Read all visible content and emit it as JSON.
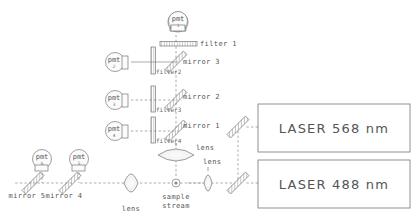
{
  "diagram": {
    "background_color": "#ffffff",
    "line_color": "#777777",
    "text_color": "#555555"
  },
  "detectors": [
    {
      "id": "pmt-1",
      "label": "pmt",
      "number": "1",
      "x": 178,
      "y": 21
    },
    {
      "id": "pmt-2",
      "label": "pmt",
      "number": "2",
      "x": 115,
      "y": 62
    },
    {
      "id": "pmt-3",
      "label": "pmt",
      "number": "3",
      "x": 115,
      "y": 100
    },
    {
      "id": "pmt-4",
      "label": "pmt",
      "number": "4",
      "x": 115,
      "y": 131
    },
    {
      "id": "pmt-5",
      "label": "pmt",
      "number": "5",
      "x": 79,
      "y": 160
    },
    {
      "id": "pmt-6",
      "label": "pmt",
      "number": "6",
      "x": 42,
      "y": 160
    }
  ],
  "filters": [
    {
      "id": "filter-1",
      "label": "filter 1",
      "orientation": "horizontal",
      "x": 180,
      "y": 44
    },
    {
      "id": "filter-2",
      "label": "filter2",
      "orientation": "vertical",
      "x": 153,
      "y": 62
    },
    {
      "id": "filter-3",
      "label": "filter3",
      "orientation": "vertical",
      "x": 153,
      "y": 100
    },
    {
      "id": "filter-4",
      "label": "filter4",
      "orientation": "vertical",
      "x": 153,
      "y": 131
    }
  ],
  "mirrors": [
    {
      "id": "mirror-1",
      "label": "mirror 1",
      "x": 185,
      "y": 125
    },
    {
      "id": "mirror-2",
      "label": "mirror 2",
      "x": 185,
      "y": 95
    },
    {
      "id": "mirror-3",
      "label": "mirror 3",
      "x": 185,
      "y": 60
    },
    {
      "id": "mirror-4",
      "label": "mirror 4",
      "x": 70,
      "y": 182
    },
    {
      "id": "mirror-5",
      "label": "mirror 5",
      "x": 32,
      "y": 182
    },
    {
      "id": "mirror-laser-568",
      "label": "",
      "x": 238,
      "y": 127
    },
    {
      "id": "mirror-laser-488",
      "label": "",
      "x": 238,
      "y": 183
    }
  ],
  "lenses": [
    {
      "id": "lens-collection",
      "label": "lens",
      "orientation": "horizontal",
      "x": 178,
      "y": 155
    },
    {
      "id": "lens-forward",
      "label": "lens",
      "orientation": "vertical",
      "x": 208,
      "y": 180
    },
    {
      "id": "lens-scatter",
      "label": "lens",
      "orientation": "vertical",
      "x": 131,
      "y": 180
    }
  ],
  "sample": {
    "id": "sample-stream",
    "label_line1": "sample",
    "label_line2": "stream",
    "x": 176,
    "y": 181
  },
  "lasers": [
    {
      "id": "laser-568",
      "label": "LASER 568 nm",
      "x": 258,
      "y": 108,
      "width": 152,
      "height": 48
    },
    {
      "id": "laser-488",
      "label": "LASER 488 nm",
      "x": 258,
      "y": 163,
      "width": 152,
      "height": 45
    }
  ]
}
